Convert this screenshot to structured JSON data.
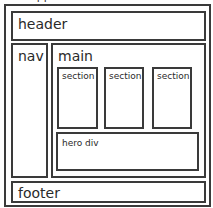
{
  "diagram": {
    "outer": {
      "label": "app"
    },
    "header": {
      "label": "header"
    },
    "nav": {
      "label": "nav"
    },
    "main": {
      "label": "main",
      "sections": [
        {
          "label": "section"
        },
        {
          "label": "section"
        },
        {
          "label": "section"
        }
      ],
      "hero": {
        "label": "hero div"
      }
    },
    "footer": {
      "label": "footer"
    },
    "colors": {
      "border": "#3a3a3a",
      "background": "#ffffff",
      "text": "#2a2a2a"
    }
  }
}
